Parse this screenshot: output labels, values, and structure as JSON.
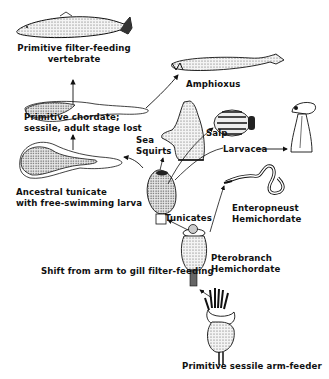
{
  "diagram": {
    "type": "evolutionary-pathway",
    "background": "#ffffff",
    "ink_color": "#111111",
    "nodes": [
      {
        "id": "arm_feeder",
        "label": "Primitive sessile arm-feeder"
      },
      {
        "id": "pterobranch",
        "label_lines": [
          "Pterobranch",
          "Hemichordate"
        ]
      },
      {
        "id": "enteropneust",
        "label_lines": [
          "Enteropneust",
          "Hemichordate"
        ]
      },
      {
        "id": "tunicates",
        "label": "Tunicates"
      },
      {
        "id": "sea_squirts",
        "label_lines": [
          "Sea",
          "Squirts"
        ]
      },
      {
        "id": "salp",
        "label": "Salp"
      },
      {
        "id": "larvacea",
        "label": "Larvacea"
      },
      {
        "id": "ancestral_tunicate",
        "label_lines": [
          "Ancestral tunicate",
          "with free-swimming larva"
        ]
      },
      {
        "id": "primitive_chordate",
        "label_lines": [
          "Primitive chordate;",
          "sessile, adult stage lost"
        ]
      },
      {
        "id": "amphioxus",
        "label": "Amphioxus"
      },
      {
        "id": "filter_vertebrate",
        "label_lines": [
          "Primitive filter-feeding",
          "vertebrate"
        ]
      }
    ],
    "annotations": [
      {
        "id": "shift_note",
        "label": "Shift from arm to gill filter-feeding"
      }
    ],
    "edges": [
      {
        "from": "arm_feeder",
        "to": "pterobranch"
      },
      {
        "from": "pterobranch",
        "to": "enteropneust"
      },
      {
        "from": "pterobranch",
        "to": "tunicates"
      },
      {
        "from": "tunicates",
        "to": "sea_squirts"
      },
      {
        "from": "tunicates",
        "to": "salp"
      },
      {
        "from": "tunicates",
        "to": "larvacea"
      },
      {
        "from": "larvacea",
        "to": "larvacea_animal"
      },
      {
        "from": "tunicates",
        "to": "ancestral_tunicate"
      },
      {
        "from": "ancestral_tunicate",
        "to": "primitive_chordate"
      },
      {
        "from": "primitive_chordate",
        "to": "amphioxus"
      },
      {
        "from": "primitive_chordate",
        "to": "filter_vertebrate"
      }
    ]
  }
}
